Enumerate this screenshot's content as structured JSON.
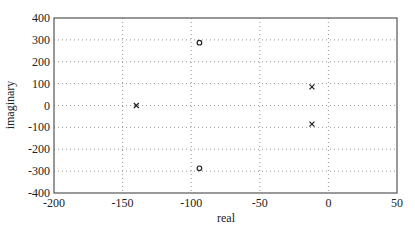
{
  "chart_data": {
    "type": "scatter",
    "title": "",
    "xlabel": "real",
    "ylabel": "imaginary",
    "xlim": [
      -200,
      50
    ],
    "ylim": [
      -400,
      400
    ],
    "xticks": [
      -200,
      -150,
      -100,
      -50,
      0,
      50
    ],
    "yticks": [
      400,
      300,
      200,
      100,
      0,
      -100,
      -200,
      -300,
      -400
    ],
    "grid": true,
    "series": [
      {
        "name": "poles",
        "marker": "x",
        "points": [
          [
            -140,
            0
          ],
          [
            -12,
            85
          ],
          [
            -12,
            -85
          ]
        ]
      },
      {
        "name": "zeros",
        "marker": "o",
        "points": [
          [
            -94,
            287
          ],
          [
            -94,
            -287
          ]
        ]
      }
    ]
  },
  "colors": {
    "axis": "#555555",
    "grid": "#999999",
    "marker": "#222222"
  }
}
